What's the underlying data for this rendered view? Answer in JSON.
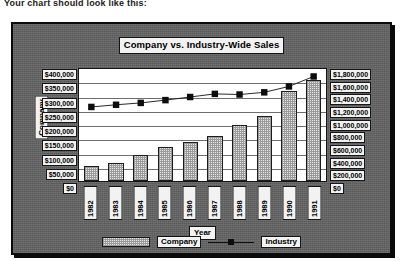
{
  "caption": "Your chart should look like this:",
  "chart_data": {
    "type": "bar",
    "title": "Company vs. Industry-Wide Sales",
    "xlabel": "Year",
    "ylabel": "Company",
    "categories": [
      "1982",
      "1983",
      "1984",
      "1985",
      "1986",
      "1987",
      "1988",
      "1989",
      "1990",
      "1991"
    ],
    "grid": true,
    "legend_position": "bottom",
    "series": [
      {
        "name": "Company",
        "type": "bar",
        "axis": "left",
        "values": [
          55000,
          65000,
          92000,
          122000,
          138000,
          162000,
          200000,
          232000,
          320000,
          362000
        ]
      },
      {
        "name": "Industry",
        "type": "line",
        "axis": "right",
        "values": [
          1190000,
          1225000,
          1255000,
          1300000,
          1350000,
          1400000,
          1390000,
          1425000,
          1520000,
          1680000
        ]
      }
    ],
    "left_axis": {
      "label": "Company",
      "ylim": [
        0,
        400000
      ],
      "ticks": [
        400000,
        350000,
        300000,
        250000,
        200000,
        150000,
        100000,
        50000,
        0
      ],
      "tick_labels": [
        "$400,000",
        "$350,000",
        "$300,000",
        "$250,000",
        "$200,000",
        "$150,000",
        "$100,000",
        "$50,000",
        "$0"
      ]
    },
    "right_axis": {
      "label": "Industry",
      "ylim": [
        0,
        1800000
      ],
      "ticks": [
        1800000,
        1600000,
        1400000,
        1200000,
        1000000,
        800000,
        600000,
        400000,
        200000,
        0
      ],
      "tick_labels": [
        "$1,800,000",
        "$1,600,000",
        "$1,400,000",
        "$1,200,000",
        "$1,000,000",
        "$800,000",
        "$600,000",
        "$400,000",
        "$200,000",
        "$0"
      ]
    },
    "legend": [
      {
        "name": "Company",
        "marker": "hatched-swatch"
      },
      {
        "name": "Industry",
        "marker": "line-with-square-point"
      }
    ],
    "colors": {
      "plate": "#636363",
      "plot_background": "#ffffff",
      "bar_fill": "#e8e8e8",
      "bar_edge": "#1c1c1c",
      "line": "#111111",
      "marker": "#0d0d0d",
      "gridline": "#6e6e6e",
      "label_box": "#f2f2f2",
      "border": "#0b0b0b"
    }
  }
}
